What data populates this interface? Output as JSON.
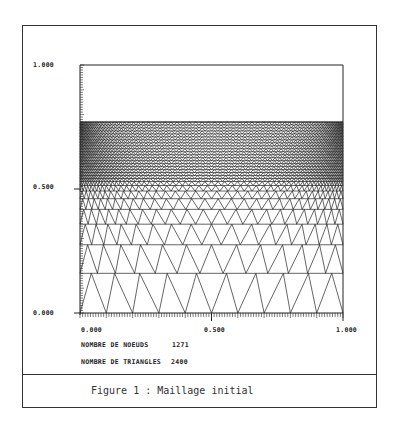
{
  "figure": {
    "caption": "Figure 1 : Maillage initial",
    "stats": {
      "nodes_label": "NOMBRE DE NOEUDS",
      "nodes_value": "1271",
      "triangles_label": "NOMBRE DE TRIANGLES",
      "triangles_value": "2400"
    },
    "axes": {
      "y_ticks": [
        "1.000",
        "0.500",
        "0.000"
      ],
      "x_ticks": [
        "0.000",
        "0.500",
        "1.000"
      ]
    }
  },
  "chart_data": {
    "type": "mesh",
    "title": "Maillage initial",
    "xlabel": "",
    "ylabel": "",
    "xlim": [
      0,
      1
    ],
    "ylim": [
      0,
      1
    ],
    "x_tick_labels": [
      "0.000",
      "0.500",
      "1.000"
    ],
    "y_tick_labels": [
      "0.000",
      "0.500",
      "1.000"
    ],
    "mesh_domain": {
      "x": [
        0,
        1
      ],
      "y": [
        0,
        0.77
      ]
    },
    "nodes": 1271,
    "triangles": 2400,
    "refinement": "graded toward top boundary, denser near x = 0.5",
    "annotations": [
      "NOMBRE DE NOEUDS 1271",
      "NOMBRE DE TRIANGLES 2400"
    ]
  },
  "colors": {
    "line": "#222222",
    "background": "#ffffff"
  }
}
